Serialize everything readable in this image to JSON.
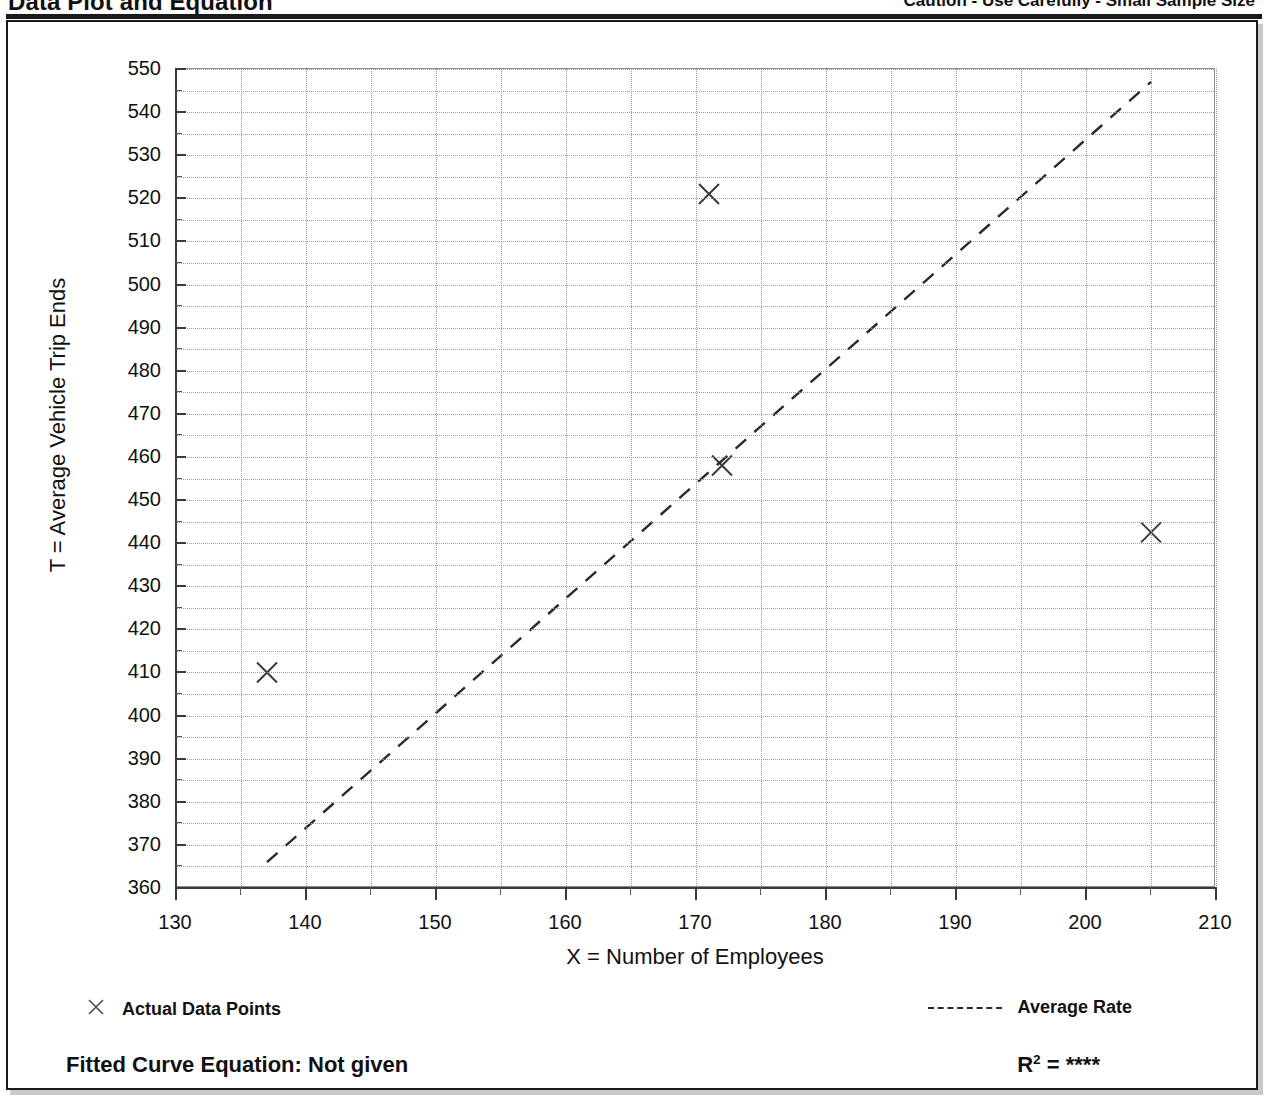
{
  "header": {
    "title": "Data Plot and Equation",
    "caution": "Caution - Use Carefully - Small Sample Size"
  },
  "legend": {
    "data_points_label": "Actual Data Points",
    "average_rate_label": "Average Rate",
    "marker_icon": "x-marker-icon",
    "line_icon": "dashed-line-icon"
  },
  "footer": {
    "fitted_equation_label": "Fitted Curve Equation:  Not given",
    "r_squared_prefix": "R",
    "r_squared_exponent": "2",
    "r_squared_equals": " = ",
    "r_squared_value": "****"
  },
  "chart_data": {
    "type": "scatter",
    "title": "Data Plot and Equation",
    "subtitle": "Caution - Use Carefully - Small Sample Size",
    "xlabel": "X = Number of Employees",
    "ylabel": "T = Average Vehicle Trip Ends",
    "xlim": [
      130,
      210
    ],
    "ylim": [
      360,
      550
    ],
    "x_major_ticks": [
      130,
      140,
      150,
      160,
      170,
      180,
      190,
      200,
      210
    ],
    "x_minor_step": 5,
    "y_major_ticks": [
      360,
      370,
      380,
      390,
      400,
      410,
      420,
      430,
      440,
      450,
      460,
      470,
      480,
      490,
      500,
      510,
      520,
      530,
      540,
      550
    ],
    "y_minor_step": 5,
    "grid": true,
    "legend_position": "below-plot",
    "series": [
      {
        "name": "Actual Data Points",
        "type": "scatter",
        "marker": "x",
        "color": "#3a3a3a",
        "points": [
          {
            "x": 137,
            "y": 410
          },
          {
            "x": 171,
            "y": 521
          },
          {
            "x": 172,
            "y": 458
          },
          {
            "x": 205,
            "y": 442.5
          }
        ]
      },
      {
        "name": "Average Rate",
        "type": "line",
        "style": "dashed",
        "color": "#2a2a2a",
        "points": [
          {
            "x": 137,
            "y": 366
          },
          {
            "x": 205,
            "y": 547
          }
        ]
      }
    ],
    "annotations": {
      "fitted_curve_equation": "Not given",
      "r_squared": "****"
    }
  }
}
